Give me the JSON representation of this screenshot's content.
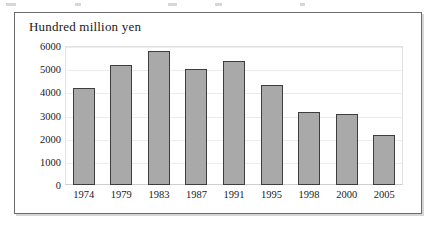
{
  "chart_data": {
    "type": "bar",
    "title": "Hundred million yen",
    "xlabel": "",
    "ylabel": "Hundred million yen",
    "categories": [
      "1974",
      "1979",
      "1983",
      "1987",
      "1991",
      "1995",
      "1998",
      "2000",
      "2005"
    ],
    "values": [
      4200,
      5200,
      5800,
      5000,
      5350,
      4300,
      3150,
      3050,
      2150
    ],
    "ylim": [
      0,
      6000
    ],
    "yticks": [
      0,
      1000,
      2000,
      3000,
      4000,
      5000,
      6000
    ],
    "ytick_labels": [
      "0",
      "1000",
      "2000",
      "3000",
      "4000",
      "5000",
      "6000"
    ],
    "grid": true,
    "legend": null,
    "bar_color": "#a9a9a9",
    "bar_edge_color": "#3d3d3d",
    "gridline_color": "#ececec",
    "frame_color": "#6b6b6b",
    "text_color": "#1a1a1a"
  }
}
